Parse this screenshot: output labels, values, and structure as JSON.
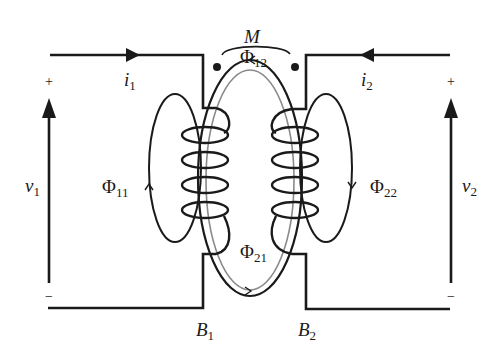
{
  "figure": {
    "type": "coupled-inductor-circuit",
    "mutual_inductance_label": "M",
    "colors": {
      "wire": "#1a1a1a",
      "flux_inner": "#8a8a8a",
      "background": "#ffffff"
    }
  },
  "labels": {
    "mutual": {
      "sym": "M"
    },
    "phi12": {
      "sym": "Φ",
      "sub": "12"
    },
    "phi21": {
      "sym": "Φ",
      "sub": "21"
    },
    "phi11": {
      "sym": "Φ",
      "sub": "11"
    },
    "phi22": {
      "sym": "Φ",
      "sub": "22"
    },
    "i1": {
      "sym": "i",
      "sub": "1"
    },
    "i2": {
      "sym": "i",
      "sub": "2"
    },
    "v1": {
      "sym": "v",
      "sub": "1"
    },
    "v2": {
      "sym": "v",
      "sub": "2"
    },
    "b1": {
      "sym": "B",
      "sub": "1"
    },
    "b2": {
      "sym": "B",
      "sub": "2"
    }
  },
  "polarity": {
    "v1_plus": "+",
    "v1_minus": "−",
    "v2_plus": "+",
    "v2_minus": "−"
  },
  "components": [
    {
      "name": "coil-1",
      "turns": 4,
      "side": "left"
    },
    {
      "name": "coil-2",
      "turns": 4,
      "side": "right"
    },
    {
      "name": "dot-markers",
      "count": 2
    }
  ]
}
